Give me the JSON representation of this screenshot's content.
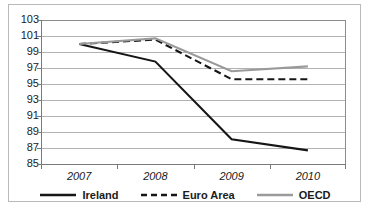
{
  "chart_data": {
    "type": "line",
    "title": "",
    "xlabel": "",
    "ylabel": "",
    "categories": [
      "2007",
      "2008",
      "2009",
      "2010"
    ],
    "ylim": [
      85,
      103
    ],
    "ytick_step": 2,
    "yticks": [
      103,
      101,
      99,
      97,
      95,
      93,
      91,
      89,
      87,
      85
    ],
    "grid": true,
    "legend_position": "bottom",
    "series": [
      {
        "name": "Ireland",
        "values": [
          100.0,
          97.8,
          88.1,
          86.7
        ],
        "color": "#161616",
        "style": "solid",
        "width": 2.1
      },
      {
        "name": "Euro Area",
        "values": [
          100.0,
          100.55,
          95.6,
          95.6
        ],
        "color": "#161616",
        "style": "dashed",
        "width": 2.1
      },
      {
        "name": "OECD",
        "values": [
          100.0,
          100.7,
          96.6,
          97.2
        ],
        "color": "#9a9a9a",
        "style": "solid",
        "width": 2.1
      }
    ]
  },
  "legend": {
    "items": [
      {
        "label": "Ireland"
      },
      {
        "label": "Euro Area"
      },
      {
        "label": "OECD"
      }
    ]
  },
  "axis": {
    "y_labels": [
      "103",
      "101",
      "99",
      "97",
      "95",
      "93",
      "91",
      "89",
      "87",
      "85"
    ],
    "x_labels": [
      "2007",
      "2008",
      "2009",
      "2010"
    ]
  },
  "colors": {
    "ireland": "#161616",
    "euro_area": "#161616",
    "oecd": "#9a9a9a",
    "gridline": "#b2b2b2",
    "axis": "#7a7a7a",
    "frame": "#b9b9b9",
    "background": "#ffffff",
    "text": "#1a1a1a"
  }
}
